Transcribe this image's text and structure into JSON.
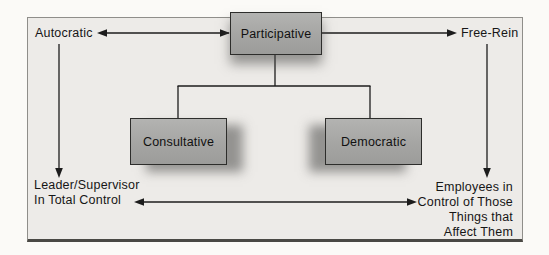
{
  "diagram": {
    "top_row": {
      "left_label": "Autocratic",
      "center_box": "Participative",
      "right_label": "Free-Rein"
    },
    "middle_boxes": {
      "left_box": "Consultative",
      "right_box": "Democratic"
    },
    "bottom_left": [
      "Leader/Supervisor",
      "In Total Control"
    ],
    "bottom_right": [
      "Employees in",
      "Control of Those",
      "Things that",
      "Affect Them"
    ],
    "colors": {
      "panel_bg": "#edebe8",
      "panel_border": "#8f8e8a",
      "box_fill": "#a7a7a5",
      "box_border": "#2d2d2b",
      "line": "#1c1c1c",
      "page_bg": "#fbfaf7"
    }
  }
}
